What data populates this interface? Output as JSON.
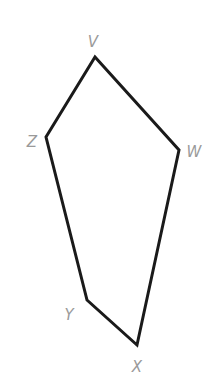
{
  "diagram": {
    "type": "polygon",
    "shape": "pentagon",
    "stroke_color": "#1a1a1a",
    "label_color": "#9a9a9a",
    "vertices": [
      {
        "label": "V",
        "x": 95,
        "y": 57,
        "lx": 93,
        "ly": 47
      },
      {
        "label": "W",
        "x": 179,
        "y": 150,
        "lx": 194,
        "ly": 157
      },
      {
        "label": "X",
        "x": 137,
        "y": 345,
        "lx": 137,
        "ly": 372
      },
      {
        "label": "Y",
        "x": 87,
        "y": 300,
        "lx": 69,
        "ly": 320
      },
      {
        "label": "Z",
        "x": 46,
        "y": 137,
        "lx": 32,
        "ly": 147
      }
    ],
    "edges": [
      [
        "V",
        "W"
      ],
      [
        "W",
        "X"
      ],
      [
        "X",
        "Y"
      ],
      [
        "Y",
        "Z"
      ],
      [
        "Z",
        "V"
      ]
    ]
  }
}
